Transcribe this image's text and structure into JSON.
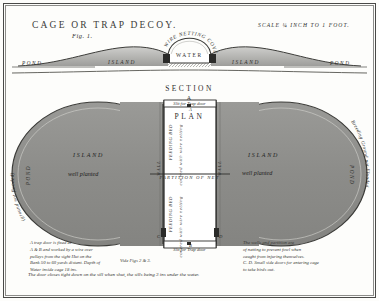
{
  "plate": {
    "title": "CAGE OR TRAP DECOY.",
    "fig_number": "Fig. 1.",
    "scale": "SCALE  ¼ INCH TO 1 FOOT.",
    "paper_color": "#fdfdfb",
    "ink_color": "#2e2e2c",
    "island_fill": "#8f8f8c",
    "border_color": "#4a4a48"
  },
  "section": {
    "heading": "SECTION",
    "point_label": "A",
    "arch_label": "WIRE NETTING COVER",
    "water_label": "WATER",
    "island_left": "ISLAND",
    "island_right": "ISLAND",
    "pond_left": "POND",
    "pond_right": "POND"
  },
  "plan": {
    "heading": "PLAN",
    "slit_top": "Slit for Trap door",
    "slit_bottom": "Slit for Trap door",
    "island_left_label": "ISLAND",
    "island_left_sub": "well planted",
    "island_right_label": "ISLAND",
    "island_right_sub": "well planted",
    "pond_left": "POND",
    "pond_right": "POND",
    "arc_left": "(ground not flooded)",
    "arc_right": "Breeding Ground not Flooded",
    "feeding_bed_top": "FEEDING BED",
    "covered_top": "covered with wire netting",
    "feeding_bed_bottom": "FEEDING BED",
    "covered_bottom": "covered with wire netting",
    "wall_left": "WALL",
    "wall_right": "WALL",
    "partition": "PARTITION OF NET",
    "callout_a": "A",
    "callout_b": "B",
    "callout_c": "C",
    "callout_d": "D"
  },
  "captions": {
    "left": [
      "A trap door is fixed at",
      "A & B and worked by a wire over",
      "pulleys from the sight Hut on the",
      "Bank 50 to 60 yards distant.  Depth of",
      "Water inside cage 18 ins."
    ],
    "middle": "Vide Figs 2 & 3.",
    "right": [
      "The walls and partition are",
      "of netting to prevent fowl when",
      "caught from injuring themselves.",
      "C. D. Small side doors for entering cage",
      "to take birds out."
    ],
    "bottom": "The door closes tight down on the sill when shut, the sills being 3 ins under the water."
  }
}
